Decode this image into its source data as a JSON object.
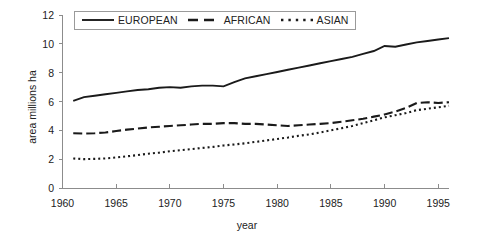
{
  "chart_data": {
    "type": "line",
    "title": "",
    "xlabel": "year",
    "ylabel": "area  millions ha",
    "xlim": [
      1960,
      1996
    ],
    "ylim": [
      0,
      12
    ],
    "xticks": [
      1960,
      1965,
      1970,
      1975,
      1980,
      1985,
      1990,
      1995
    ],
    "yticks": [
      0,
      2,
      4,
      6,
      8,
      10,
      12
    ],
    "grid": false,
    "legend_position": "top-center",
    "x": [
      1961,
      1962,
      1963,
      1964,
      1965,
      1966,
      1967,
      1968,
      1969,
      1970,
      1971,
      1972,
      1973,
      1974,
      1975,
      1976,
      1977,
      1978,
      1979,
      1980,
      1981,
      1982,
      1983,
      1984,
      1985,
      1986,
      1987,
      1988,
      1989,
      1990,
      1991,
      1992,
      1993,
      1994,
      1995,
      1996
    ],
    "series": [
      {
        "name": "EUROPEAN",
        "style": "solid",
        "color": "#1a1a1a",
        "values": [
          6.05,
          6.3,
          6.4,
          6.5,
          6.6,
          6.7,
          6.8,
          6.85,
          6.95,
          7.0,
          6.95,
          7.05,
          7.1,
          7.1,
          7.05,
          7.35,
          7.6,
          7.75,
          7.9,
          8.05,
          8.2,
          8.35,
          8.5,
          8.65,
          8.8,
          8.95,
          9.1,
          9.3,
          9.5,
          9.85,
          9.8,
          9.95,
          10.1,
          10.2,
          10.3,
          10.4
        ]
      },
      {
        "name": "AFRICAN",
        "style": "dashed",
        "color": "#1a1a1a",
        "values": [
          3.8,
          3.78,
          3.8,
          3.85,
          3.95,
          4.05,
          4.12,
          4.2,
          4.25,
          4.3,
          4.35,
          4.4,
          4.45,
          4.45,
          4.5,
          4.5,
          4.45,
          4.45,
          4.4,
          4.35,
          4.3,
          4.35,
          4.4,
          4.45,
          4.5,
          4.6,
          4.7,
          4.8,
          4.95,
          5.1,
          5.3,
          5.55,
          5.9,
          5.95,
          5.9,
          5.95
        ]
      },
      {
        "name": "ASIAN",
        "style": "dotted",
        "color": "#1a1a1a",
        "values": [
          2.05,
          2.0,
          2.02,
          2.05,
          2.12,
          2.2,
          2.28,
          2.38,
          2.45,
          2.55,
          2.62,
          2.7,
          2.78,
          2.85,
          2.95,
          3.02,
          3.1,
          3.2,
          3.3,
          3.4,
          3.5,
          3.62,
          3.72,
          3.85,
          4.0,
          4.15,
          4.3,
          4.5,
          4.7,
          4.9,
          5.05,
          5.2,
          5.4,
          5.5,
          5.6,
          5.7
        ]
      }
    ]
  },
  "legend": {
    "items": [
      {
        "label": "EUROPEAN"
      },
      {
        "label": "AFRICAN"
      },
      {
        "label": "ASIAN"
      }
    ]
  }
}
